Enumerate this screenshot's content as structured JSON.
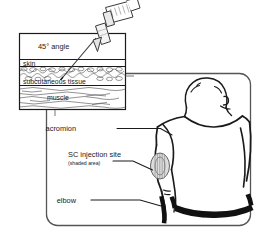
{
  "figure": {
    "inset": {
      "name": "cross-section-inset",
      "angle_label": "45° angle",
      "layers": [
        {
          "key": "skin",
          "label": "skin"
        },
        {
          "key": "subcutaneous",
          "label": "subcutaneous tissue"
        },
        {
          "key": "muscle",
          "label": "muscle"
        }
      ],
      "syringe_name": "syringe",
      "needle_name": "needle"
    },
    "main_panel": {
      "name": "body-diagram-panel",
      "subject": "rear view of upper body, left arm",
      "callouts": [
        {
          "key": "acromion",
          "label": "acromion",
          "sublabel": ""
        },
        {
          "key": "sc_injection_site",
          "label": "SC injection site",
          "sublabel": "(shaded area)"
        },
        {
          "key": "elbow",
          "label": "elbow",
          "sublabel": ""
        }
      ]
    },
    "colors": {
      "ink": "#1a1a1a",
      "line": "#2b2b2b",
      "panel_border": "#555555",
      "shade_fill": "#d8d8d8",
      "background": "#ffffff"
    }
  }
}
